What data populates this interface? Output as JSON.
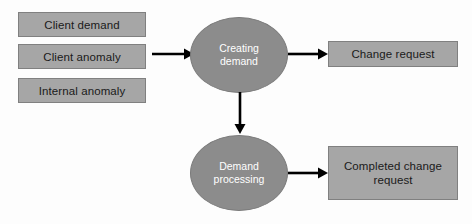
{
  "diagram": {
    "type": "flowchart",
    "background_color": "#fdfdfd",
    "box_fill_color": "#a6a6a6",
    "box_border_color": "#808080",
    "ellipse_fill_color": "#8c8c8c",
    "ellipse_text_color": "#ffffff",
    "connector_color": "#000000",
    "inputs": [
      {
        "label": "Client demand",
        "name": "client-demand"
      },
      {
        "label": "Client anomaly",
        "name": "client-anomaly"
      },
      {
        "label": "Internal anomaly",
        "name": "internal-anomaly"
      }
    ],
    "processes": [
      {
        "line1": "Creating",
        "line2": "demand",
        "name": "creating-demand"
      },
      {
        "line1": "Demand",
        "line2": "processing",
        "name": "demand-processing"
      }
    ],
    "outputs": [
      {
        "line1": "Change request",
        "line2": "",
        "name": "change-request"
      },
      {
        "line1": "Completed change",
        "line2": "request",
        "name": "completed-change-request"
      }
    ],
    "connectors": [
      {
        "name": "inputs-to-creating-demand",
        "direction": "right"
      },
      {
        "name": "creating-demand-to-change-request",
        "direction": "right"
      },
      {
        "name": "creating-demand-to-demand-processing",
        "direction": "down"
      },
      {
        "name": "demand-processing-to-completed-change-request",
        "direction": "right"
      }
    ]
  }
}
